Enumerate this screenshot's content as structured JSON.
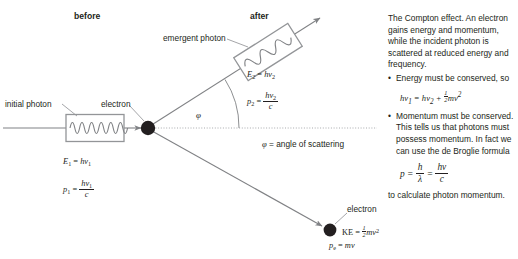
{
  "figure": {
    "title_before": "before",
    "title_after": "after",
    "labels": {
      "initial_photon": "initial photon",
      "electron_at_rest": "electron",
      "emergent_photon": "emergent photon",
      "scattered_electron": "electron",
      "angle_symbol": "φ",
      "angle_definition": "φ = angle of scattering"
    },
    "incident_photon": {
      "energy_lhs": "E",
      "energy_sub": "1",
      "energy_rhs_h": "h",
      "energy_rhs_nu": "ν",
      "energy_rhs_sub": "1",
      "momentum_lhs": "p",
      "momentum_sub": "1",
      "momentum_num_h": "h",
      "momentum_num_nu": "ν",
      "momentum_num_sub": "1",
      "momentum_den": "c",
      "wave_cycles": 6
    },
    "emergent_photon": {
      "energy_lhs": "E",
      "energy_sub": "2",
      "energy_rhs_h": "h",
      "energy_rhs_nu": "ν",
      "energy_rhs_sub": "2",
      "momentum_lhs": "p",
      "momentum_sub": "2",
      "momentum_num_h": "h",
      "momentum_num_nu": "ν",
      "momentum_num_sub": "2",
      "momentum_den": "c",
      "wave_cycles": 3
    },
    "recoil_electron": {
      "ke_lhs": "KE",
      "ke_half_num": "1",
      "ke_half_den": "2",
      "ke_m": "m",
      "ke_v": "v",
      "ke_exp": "2",
      "momentum_lhs": "p",
      "momentum_sub": "e",
      "momentum_rhs": "mv"
    },
    "colors": {
      "ray": "#808285",
      "wave_box": "#939598",
      "electron_dot": "#231f20",
      "leader": "#939598",
      "dotted_axis": "#a7a9ac",
      "text": "#231f20"
    }
  },
  "notes": {
    "intro": "The Compton effect. An electron gains energy and momentum, while the incident photon is scattered at reduced energy and frequency.",
    "bullet_marker": "•",
    "bullet_1": "Energy must be conserved, so",
    "equation_1": {
      "h1": "h",
      "nu1": "ν",
      "sub1": "1",
      "eq": "=",
      "h2": "h",
      "nu2": "ν",
      "sub2": "2",
      "plus": "+",
      "half_num": "1",
      "half_den": "2",
      "m": "m",
      "v": "v",
      "exp": "2"
    },
    "bullet_2": "Momentum must be conserved. This tells us that photons must possess momentum. In fact we can use the de Broglie formula",
    "equation_2": {
      "p": "p",
      "eq1": "=",
      "num_h": "h",
      "den_lambda": "λ",
      "eq2": "=",
      "num_hnu": "hν",
      "den_c": "c"
    },
    "closing": "to calculate photon momentum."
  }
}
